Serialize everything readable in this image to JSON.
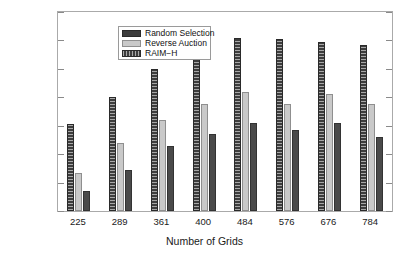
{
  "chart_data": {
    "type": "bar",
    "title": "",
    "xlabel": "Number of Grids",
    "ylabel": "Weighted Social Welfare",
    "categories": [
      "225",
      "289",
      "361",
      "400",
      "484",
      "576",
      "676",
      "784"
    ],
    "series": [
      {
        "name": "RAIM-H",
        "legend_label": "RAIM−H",
        "color": "#3d3d3d",
        "pattern": "hatched",
        "values": [
          305,
          400,
          500,
          560,
          610,
          605,
          595,
          585
        ]
      },
      {
        "name": "Reverse Auction",
        "legend_label": "Reverse Auction",
        "color": "#c9c9c9",
        "pattern": "solid",
        "values": [
          135,
          240,
          320,
          375,
          420,
          375,
          410,
          375
        ]
      },
      {
        "name": "Random Selection",
        "legend_label": "Random Selection",
        "color": "#4a4a4a",
        "pattern": "solid",
        "values": [
          70,
          145,
          230,
          270,
          310,
          285,
          310,
          260
        ]
      }
    ],
    "ylim": [
      0,
      700
    ],
    "yticks": [
      0,
      100,
      200,
      300,
      400,
      500,
      600,
      700
    ],
    "ytick_labels": [
      "0",
      "100",
      "200",
      "300",
      "400",
      "500",
      "600",
      "700"
    ],
    "grid": false,
    "legend_position": "upper left",
    "bar_draw_order": [
      "RAIM-H",
      "Reverse Auction",
      "Random Selection"
    ]
  },
  "legend": {
    "entries": [
      {
        "label": "Random Selection"
      },
      {
        "label": "Reverse Auction"
      },
      {
        "label": "RAIM−H"
      }
    ]
  }
}
